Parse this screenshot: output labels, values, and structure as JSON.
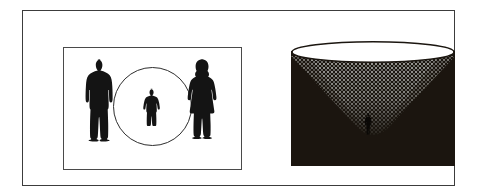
{
  "figure": {
    "caption": "",
    "background_color": "#ffffff",
    "frame_color": "#3c3c3c"
  },
  "left_panel": {
    "name": "scale-comparison-panel",
    "border_color": "#4a4a4a",
    "background_color": "#ffffff",
    "figures": [
      {
        "id": "adult-male",
        "icon": "adult-male-silhouette-icon",
        "fill": "#141414",
        "height_px": 82
      },
      {
        "id": "child",
        "icon": "child-silhouette-icon",
        "fill": "#141414",
        "height_px": 36
      },
      {
        "id": "adult-female",
        "icon": "adult-female-silhouette-icon",
        "fill": "#141414",
        "height_px": 80
      }
    ],
    "circle": {
      "icon": "circle-outline-icon",
      "stroke": "#2e2e2e",
      "diameter_px": 79
    }
  },
  "right_panel": {
    "name": "halftone-cone-panel",
    "background_color": "#1b1610",
    "cone": {
      "icon": "inverted-cone-icon",
      "halftone_fill": "#8c8c8c",
      "rim_fill": "#ffffff",
      "rim_stroke": "#1b1610"
    },
    "figure": {
      "id": "cone-bottom-figure",
      "icon": "standing-person-silhouette-icon",
      "fill": "#0a0806",
      "height_px": 22
    }
  }
}
